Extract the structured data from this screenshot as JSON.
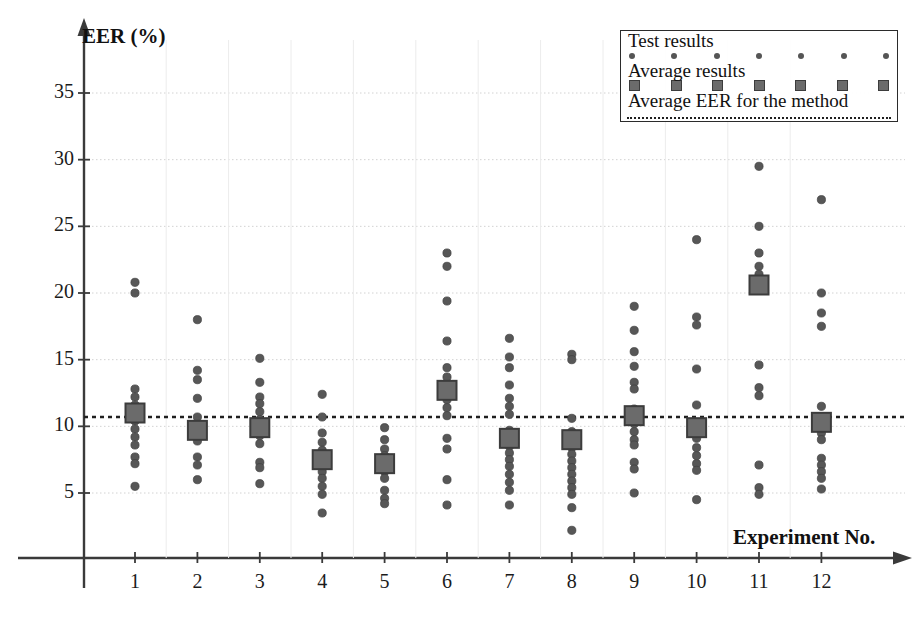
{
  "chart_data": {
    "type": "scatter",
    "title": "",
    "xlabel": "Experiment No.",
    "ylabel": "EER (%)",
    "xlim": [
      0.35,
      12.9
    ],
    "ylim": [
      0,
      38.5
    ],
    "yticks": [
      5,
      10,
      15,
      20,
      25,
      30,
      35
    ],
    "xticks": [
      1,
      2,
      3,
      4,
      5,
      6,
      7,
      8,
      9,
      10,
      11,
      12
    ],
    "grid": "horizontal-dotted",
    "legend_position": "top-right",
    "average_eer_for_method": 10.7,
    "series": [
      {
        "name": "Test results",
        "marker": "circle",
        "color": "#575757",
        "groups": [
          {
            "x": 1,
            "values": [
              20.8,
              20.0,
              12.8,
              12.2,
              11.6,
              10.4,
              9.8,
              9.2,
              8.6,
              7.7,
              7.2,
              5.5
            ]
          },
          {
            "x": 2,
            "values": [
              18.0,
              14.2,
              13.5,
              12.1,
              10.7,
              10.0,
              9.4,
              8.9,
              7.7,
              7.1,
              6.0
            ]
          },
          {
            "x": 3,
            "values": [
              15.1,
              13.3,
              12.2,
              11.7,
              11.1,
              10.5,
              9.9,
              9.3,
              8.7,
              7.3,
              6.9,
              5.7
            ]
          },
          {
            "x": 4,
            "values": [
              12.4,
              10.7,
              9.5,
              8.8,
              8.2,
              7.6,
              7.1,
              6.6,
              6.1,
              5.5,
              4.9,
              3.5
            ]
          },
          {
            "x": 5,
            "values": [
              9.9,
              9.0,
              8.3,
              7.8,
              7.2,
              6.6,
              6.1,
              5.2,
              4.6,
              4.2
            ]
          },
          {
            "x": 6,
            "values": [
              23.0,
              22.0,
              19.4,
              16.4,
              14.4,
              13.7,
              12.0,
              11.4,
              10.8,
              9.1,
              8.3,
              6.0,
              4.1
            ]
          },
          {
            "x": 7,
            "values": [
              16.6,
              15.2,
              14.4,
              13.1,
              12.1,
              11.5,
              10.9,
              9.7,
              9.0,
              8.5,
              8.0,
              7.5,
              7.0,
              6.4,
              5.8,
              5.2,
              4.1
            ]
          },
          {
            "x": 8,
            "values": [
              15.4,
              15.0,
              10.6,
              9.6,
              8.4,
              7.9,
              7.4,
              6.9,
              6.4,
              5.9,
              5.4,
              4.9,
              3.9,
              2.2
            ]
          },
          {
            "x": 9,
            "values": [
              19.0,
              17.2,
              15.6,
              14.5,
              13.3,
              12.8,
              11.3,
              10.2,
              9.6,
              9.0,
              8.6,
              7.3,
              6.8,
              5.0
            ]
          },
          {
            "x": 10,
            "values": [
              24.0,
              18.2,
              17.6,
              14.3,
              11.6,
              9.1,
              8.4,
              7.8,
              7.2,
              6.7,
              4.5
            ]
          },
          {
            "x": 11,
            "values": [
              29.5,
              25.0,
              23.0,
              22.0,
              21.4,
              20.9,
              14.6,
              12.9,
              12.3,
              7.1,
              5.4,
              4.9
            ]
          },
          {
            "x": 12,
            "values": [
              27.0,
              20.0,
              18.5,
              17.5,
              11.5,
              10.0,
              9.5,
              9.0,
              7.6,
              7.1,
              6.6,
              6.1,
              5.3
            ]
          }
        ]
      },
      {
        "name": "Average results",
        "marker": "square",
        "color": "#6b6b6b",
        "points": [
          {
            "x": 1,
            "y": 11.0
          },
          {
            "x": 2,
            "y": 9.7
          },
          {
            "x": 3,
            "y": 9.9
          },
          {
            "x": 4,
            "y": 7.5
          },
          {
            "x": 5,
            "y": 7.2
          },
          {
            "x": 6,
            "y": 12.7
          },
          {
            "x": 7,
            "y": 9.1
          },
          {
            "x": 8,
            "y": 9.0
          },
          {
            "x": 9,
            "y": 10.8
          },
          {
            "x": 10,
            "y": 9.9
          },
          {
            "x": 11,
            "y": 20.6
          },
          {
            "x": 12,
            "y": 10.3
          }
        ]
      }
    ]
  },
  "axes": {
    "y_title": "EER (%)",
    "x_title": "Experiment No.",
    "y_tick_labels": [
      "35",
      "30",
      "25",
      "20",
      "15",
      "10",
      "5"
    ],
    "x_tick_labels": [
      "1",
      "2",
      "3",
      "4",
      "5",
      "6",
      "7",
      "8",
      "9",
      "10",
      "11",
      "12"
    ]
  },
  "legend": {
    "entries": [
      {
        "label": "Test results",
        "symbol": "dot"
      },
      {
        "label": "Average results",
        "symbol": "square"
      },
      {
        "label": "Average EER for the method",
        "symbol": "dashed-line"
      }
    ]
  },
  "colors": {
    "marker": "#575757",
    "average_marker_fill": "#6b6b6b",
    "average_marker_stroke": "#3c3c3c",
    "axis": "#3a3a3a",
    "grid": "#d2d2d2",
    "dash_line": "#1f1f1f",
    "background": "#ffffff"
  }
}
